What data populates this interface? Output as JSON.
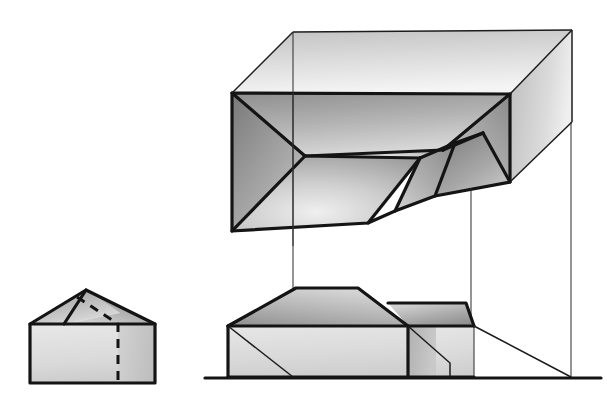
{
  "drawing": {
    "title": "Hipped Roof Geometry Study",
    "background_color": "#ffffff",
    "line_color": "#141414",
    "thin_line_color": "#2b2b2b",
    "canvas": {
      "width": 607,
      "height": 403
    },
    "figures": [
      {
        "name": "gable-reference-solid",
        "label": "Small gabled block",
        "description": "Reference solid at lower left with a gable roof and one dashed hidden edge"
      },
      {
        "name": "isometric-hipped-roof",
        "label": "Isometric hipped roof within bounding box",
        "description": "Axonometric view of a hipped roof mass with a lower stepped wing, drawn inside a wireframe bounding box"
      },
      {
        "name": "front-elevation",
        "label": "Front elevation",
        "description": "Orthographic front elevation of the same mass resting on a ground line"
      },
      {
        "name": "projection-lines",
        "label": "Vertical projection lines",
        "description": "Three thin vertical construction lines linking the isometric view to the elevation"
      }
    ],
    "shading": {
      "roof_dark": "#7c7c7c",
      "roof_mid": "#9a9a9a",
      "roof_light": "#c9c9c9",
      "wall_light": "#dcdcdc",
      "wall_mid": "#bdbdbd",
      "wall_pale": "#e8e8e8",
      "highlight": "#f2f2f2"
    },
    "geometry": {
      "ground_line": {
        "x1": 205,
        "y": 378,
        "x2": 601
      },
      "projection_x": [
        293,
        471,
        571
      ]
    }
  }
}
